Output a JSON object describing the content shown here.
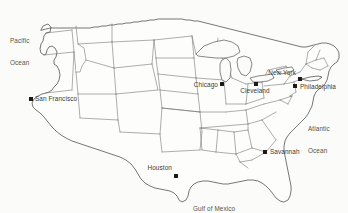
{
  "map": {
    "title": "Map of the contiguous United States",
    "region": "United States",
    "style": "outline map with state boundaries",
    "background_color": "#fbfbfa",
    "boundary_color": "#6b6b68",
    "coastline_color": "#4a4a48",
    "marker_color": "#1a1a1a",
    "label_color": "#3a3a38",
    "width": 348,
    "height": 213
  },
  "cities": [
    {
      "name": "San Francisco",
      "label": "San Francisco",
      "marker_x": 31,
      "marker_y": 99,
      "label_x": 35,
      "label_y": 99,
      "label_anchor": "right"
    },
    {
      "name": "Chicago",
      "label": "Chicago",
      "marker_x": 222,
      "marker_y": 84,
      "label_x": 218,
      "label_y": 85,
      "label_anchor": "left"
    },
    {
      "name": "Cleveland",
      "label": "Cleveland",
      "marker_x": 256,
      "marker_y": 84,
      "label_x": 255,
      "label_y": 91,
      "label_anchor": "center"
    },
    {
      "name": "New York",
      "label": "New York",
      "marker_x": 300,
      "marker_y": 79,
      "label_x": 296,
      "label_y": 73,
      "label_anchor": "left"
    },
    {
      "name": "Philadelphia",
      "label": "Philadelphia",
      "marker_x": 295,
      "marker_y": 86,
      "label_x": 300,
      "label_y": 87,
      "label_anchor": "right"
    },
    {
      "name": "Savannah",
      "label": "Savannah",
      "marker_x": 265,
      "marker_y": 152,
      "label_x": 270,
      "label_y": 152,
      "label_anchor": "right"
    },
    {
      "name": "Houston",
      "label": "Houston",
      "marker_x": 176,
      "marker_y": 176,
      "label_x": 172,
      "label_y": 168,
      "label_anchor": "left"
    }
  ],
  "water_labels": [
    {
      "name": "pacific-ocean",
      "line1": "Pacific",
      "line2": "Ocean",
      "x": 10,
      "y": 28,
      "anchor": "left"
    },
    {
      "name": "atlantic-ocean",
      "line1": "Atlantic",
      "line2": "Ocean",
      "x": 308,
      "y": 115,
      "anchor": "left"
    },
    {
      "name": "gulf-of-mexico",
      "line1": "Gulf of Mexico",
      "line2": "",
      "x": 193,
      "y": 193,
      "anchor": "left"
    }
  ]
}
